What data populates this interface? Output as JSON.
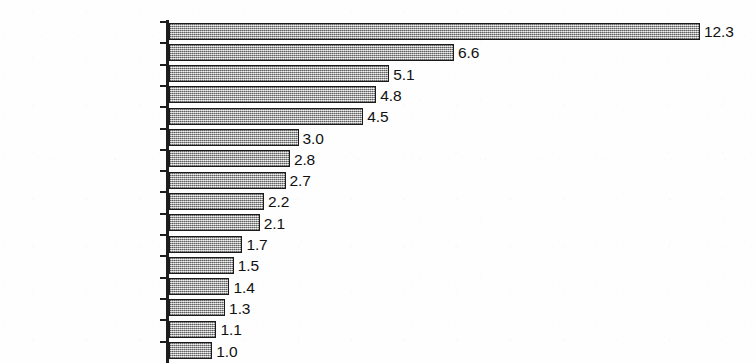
{
  "chart_data": {
    "type": "bar",
    "orientation": "horizontal",
    "title": "",
    "subtitle": "",
    "xlabel": "",
    "ylabel": "",
    "grid": false,
    "legend": null,
    "axis_visible": {
      "category_axis": true,
      "value_axis": false
    },
    "xlim": [
      0,
      12.3
    ],
    "categories": [
      "Nigeria",
      "Ethiopia",
      "Congo (Kinshasa)",
      "South Africa",
      "Sudan",
      "Kenya",
      "Ghana",
      "Tanzania",
      "Uganda",
      "Madagascar",
      "Cameroon",
      "Cote d'Ivoire",
      "Senegal",
      "Mozambique",
      "Burkina Faso",
      "Niger"
    ],
    "values": [
      12.3,
      6.6,
      5.1,
      4.8,
      4.5,
      3.0,
      2.8,
      2.7,
      2.2,
      2.1,
      1.7,
      1.5,
      1.4,
      1.3,
      1.1,
      1.0
    ],
    "value_labels": [
      "12.3",
      "6.6",
      "5.1",
      "4.8",
      "4.5",
      "3.0",
      "2.8",
      "2.7",
      "2.2",
      "2.1",
      "1.7",
      "1.5",
      "1.4",
      "1.3",
      "1.1",
      "1.0"
    ],
    "colors": {
      "bar_fill": "#b9b9b9",
      "bar_border": "#1a1a1a",
      "axis": "#1d1d1d",
      "text": "#111111",
      "background": "#fdfdfd"
    }
  }
}
